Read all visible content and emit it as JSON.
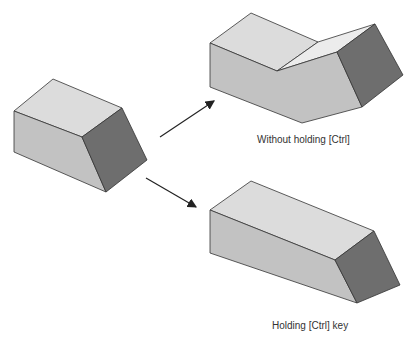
{
  "diagram": {
    "colors": {
      "top_face": "#dcdcdc",
      "front_face": "#c2c2c2",
      "side_face": "#6e6e6e",
      "crease_face": "#ececec",
      "edge": "#333333",
      "arrow": "#222222"
    },
    "source_shape": {
      "name": "original-block"
    },
    "results": [
      {
        "name": "extended-bent-block",
        "caption": "Without holding [Ctrl]"
      },
      {
        "name": "extended-straight-block",
        "caption": "Holding [Ctrl] key"
      }
    ]
  }
}
